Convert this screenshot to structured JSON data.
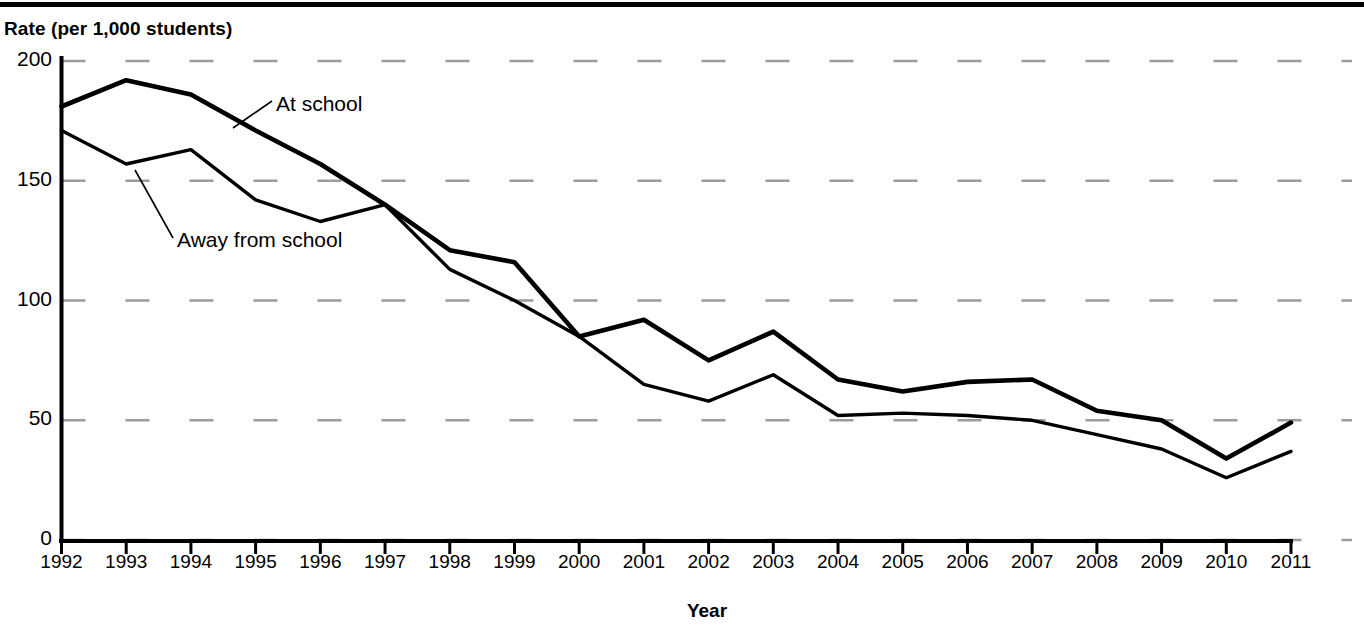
{
  "chart_data": {
    "type": "line",
    "title": "",
    "ylabel": "Rate (per 1,000 students)",
    "xlabel": "Year",
    "ylim": [
      0,
      200
    ],
    "yticks": [
      0,
      50,
      100,
      150,
      200
    ],
    "grid": "horizontal-dashed",
    "legend_position": "inline-annotations",
    "categories": [
      "1992",
      "1993",
      "1994",
      "1995",
      "1996",
      "1997",
      "1998",
      "1999",
      "2000",
      "2001",
      "2002",
      "2003",
      "2004",
      "2005",
      "2006",
      "2007",
      "2008",
      "2009",
      "2010",
      "2011"
    ],
    "series": [
      {
        "name": "At school",
        "values": [
          181,
          192,
          186,
          171,
          157,
          140,
          121,
          116,
          85,
          92,
          75,
          87,
          67,
          62,
          66,
          67,
          54,
          50,
          34,
          49
        ]
      },
      {
        "name": "Away from school",
        "values": [
          171,
          157,
          163,
          142,
          133,
          140,
          113,
          100,
          85,
          65,
          58,
          69,
          52,
          53,
          52,
          50,
          44,
          38,
          26,
          37
        ]
      }
    ]
  },
  "annotations": {
    "at_school": "At school",
    "away_from_school": "Away from school"
  },
  "axes": {
    "y_title": "Rate (per 1,000 students)",
    "x_title": "Year"
  }
}
